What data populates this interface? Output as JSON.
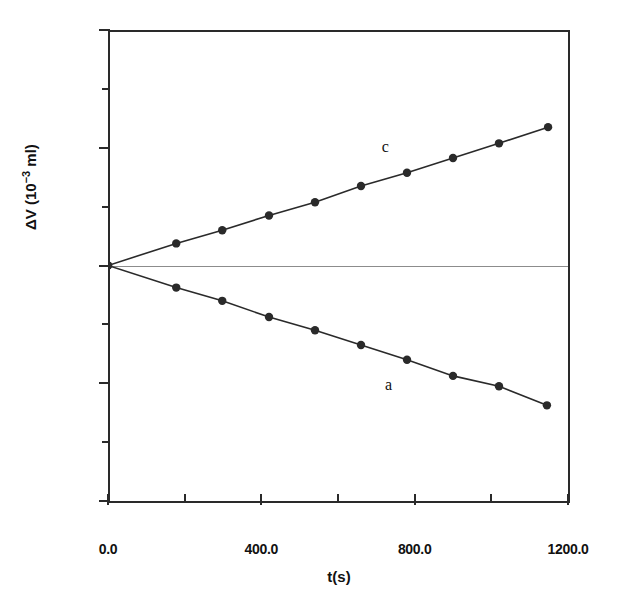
{
  "figure": {
    "background": "#ffffff",
    "ink_color": "#2a2a2a",
    "zero_line_color": "#8c8c8c"
  },
  "axes": {
    "x_title": "t(s)",
    "y_title_main": "ΔV (10",
    "y_title_exp": "−3",
    "y_title_unit": " ml)",
    "x_tick_labels": [
      "0.0",
      "400.0",
      "800.0",
      "1200.0"
    ],
    "y_tick_labels": [
      "80",
      "40",
      "0",
      "-40",
      "-80"
    ]
  },
  "chart_data": {
    "type": "scatter",
    "title": "",
    "xlabel": "t(s)",
    "ylabel": "ΔV (10⁻³ ml)",
    "xlim": [
      0,
      1200
    ],
    "ylim": [
      -80,
      80
    ],
    "x_major_ticks": [
      0,
      400,
      800,
      1200
    ],
    "x_minor_ticks": [
      200,
      600,
      1000
    ],
    "y_major_ticks": [
      80,
      40,
      0,
      -40,
      -80
    ],
    "y_minor_ticks": [
      60,
      20,
      -20,
      -60
    ],
    "grid": false,
    "legend": "inline-annotations",
    "marker": "filled-circle",
    "line_style": "solid",
    "series": [
      {
        "name": "c",
        "label": "c",
        "label_x": 730,
        "label_y": 40,
        "slope_per_s": 0.0411,
        "points": [
          {
            "x": 0,
            "y": 0.0
          },
          {
            "x": 178,
            "y": 7.5
          },
          {
            "x": 298,
            "y": 12.0
          },
          {
            "x": 420,
            "y": 17.0
          },
          {
            "x": 540,
            "y": 21.5
          },
          {
            "x": 660,
            "y": 27.0
          },
          {
            "x": 780,
            "y": 31.5
          },
          {
            "x": 900,
            "y": 36.5
          },
          {
            "x": 1020,
            "y": 41.5
          },
          {
            "x": 1148,
            "y": 47.0
          }
        ]
      },
      {
        "name": "a",
        "label": "a",
        "label_x": 738,
        "label_y": -41,
        "slope_per_s": -0.0415,
        "points": [
          {
            "x": 0,
            "y": 0.0
          },
          {
            "x": 178,
            "y": -7.5
          },
          {
            "x": 298,
            "y": -12.0
          },
          {
            "x": 420,
            "y": -17.5
          },
          {
            "x": 540,
            "y": -22.0
          },
          {
            "x": 660,
            "y": -27.0
          },
          {
            "x": 780,
            "y": -32.0
          },
          {
            "x": 900,
            "y": -37.5
          },
          {
            "x": 1020,
            "y": -41.0
          },
          {
            "x": 1145,
            "y": -47.5
          }
        ]
      }
    ]
  }
}
